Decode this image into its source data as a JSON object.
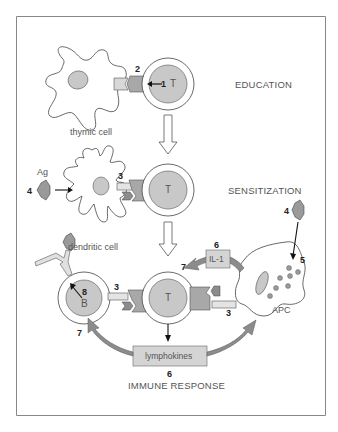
{
  "stages": {
    "education": "EDUCATION",
    "sensitization": "SENSITIZATION",
    "immune_response": "IMMUNE RESPONSE"
  },
  "cells": {
    "thymic_cell": "thymic cell",
    "dendritic_cell": "dendritic cell",
    "apc": "APC",
    "t_cell": "T",
    "b_cell": "B"
  },
  "molecules": {
    "antigen": "Ag",
    "il1": "IL-1",
    "lymphokines": "lymphokines"
  },
  "numbers": {
    "n1": "1",
    "n2": "2",
    "n3_dendritic": "3",
    "n3_b": "3",
    "n3_apc": "3",
    "n4_left": "4",
    "n4_right": "4",
    "n5": "5",
    "n6_il1": "6",
    "n6_lymph": "6",
    "n7_il1": "7",
    "n7_b": "7",
    "n8": "8"
  },
  "colors": {
    "frame": "#888888",
    "cell_outline": "#444444",
    "nucleus_fill": "#c8c8c8",
    "receptor_dark": "#a8a8a8",
    "receptor_light": "#d8d8d8",
    "antigen_fill": "#9a9a9a",
    "arrow_fill": "#8c8c8c",
    "box_fill": "#d4d4d4"
  }
}
